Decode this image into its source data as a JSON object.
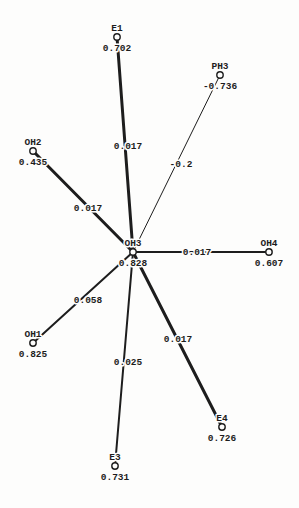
{
  "colors": {
    "ink": "#1d1d1d",
    "paper": "#fdfdfc"
  },
  "graph": {
    "type": "network",
    "center_node": "OH3",
    "nodes": [
      {
        "id": "E1",
        "label": "E1",
        "value": "0.702",
        "x": 117,
        "y": 37
      },
      {
        "id": "PH3",
        "label": "PH3",
        "value": "-0.736",
        "x": 220,
        "y": 75
      },
      {
        "id": "OH2",
        "label": "OH2",
        "value": "0.435",
        "x": 33,
        "y": 151
      },
      {
        "id": "OH3",
        "label": "OH3",
        "value": "0.828",
        "x": 133,
        "y": 252
      },
      {
        "id": "OH4",
        "label": "OH4",
        "value": "0.607",
        "x": 269,
        "y": 252
      },
      {
        "id": "OH1",
        "label": "OH1",
        "value": "0.825",
        "x": 33,
        "y": 343
      },
      {
        "id": "E3",
        "label": "E3",
        "value": "0.731",
        "x": 115,
        "y": 466
      },
      {
        "id": "E4",
        "label": "E4",
        "value": "0.726",
        "x": 222,
        "y": 427
      }
    ],
    "edges": [
      {
        "from": "OH3",
        "to": "E1",
        "label": "0.017",
        "width": 3,
        "label_x": 128,
        "label_y": 146
      },
      {
        "from": "OH3",
        "to": "PH3",
        "label": "-0.2",
        "width": 1,
        "label_x": 181,
        "label_y": 164
      },
      {
        "from": "OH3",
        "to": "OH2",
        "label": "0.017",
        "width": 3,
        "label_x": 88,
        "label_y": 208
      },
      {
        "from": "OH3",
        "to": "OH4",
        "label": "0.017",
        "width": 2,
        "label_x": 197,
        "label_y": 252
      },
      {
        "from": "OH3",
        "to": "OH1",
        "label": "0.058",
        "width": 2,
        "label_x": 88,
        "label_y": 300
      },
      {
        "from": "OH3",
        "to": "E3",
        "label": "0.025",
        "width": 2,
        "label_x": 128,
        "label_y": 362
      },
      {
        "from": "OH3",
        "to": "E4",
        "label": "0.017",
        "width": 3,
        "label_x": 178,
        "label_y": 339
      }
    ]
  }
}
